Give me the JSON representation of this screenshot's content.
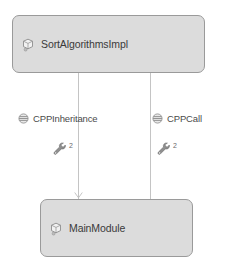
{
  "diagram": {
    "type": "dependency-graph",
    "background_color": "#ffffff",
    "node_fill_color": "#dcdcdc",
    "node_border_color": "#9a9a9a",
    "edge_color": "#c4c4c4",
    "text_color": "#3a3a3a",
    "nodes": [
      {
        "id": "sort-algorithms-impl",
        "label": "SortAlgorithmsImpl",
        "icon": "module-icon",
        "position": "top"
      },
      {
        "id": "main-module",
        "label": "MainModule",
        "icon": "module-icon",
        "position": "bottom"
      }
    ],
    "edges": [
      {
        "id": "cpp-inheritance",
        "label": "CPPInheritance",
        "icon": "relation-icon",
        "tool_icon": "wrench-icon",
        "count": "2",
        "from": "sort-algorithms-impl",
        "to": "main-module",
        "arrowhead": true
      },
      {
        "id": "cpp-call",
        "label": "CPPCall",
        "icon": "relation-icon",
        "tool_icon": "wrench-icon",
        "count": "2",
        "from": "sort-algorithms-impl",
        "to": "main-module",
        "arrowhead": false
      }
    ]
  }
}
